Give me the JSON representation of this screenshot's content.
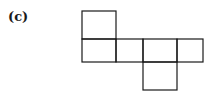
{
  "figure": {
    "label": "(c)",
    "line_color": "#1a1a1a",
    "squares": [
      {
        "id": "top",
        "x": 82,
        "y": 11,
        "w": 34,
        "h": 28
      },
      {
        "id": "row-1",
        "x": 82,
        "y": 39,
        "w": 34,
        "h": 23
      },
      {
        "id": "row-2",
        "x": 116,
        "y": 39,
        "w": 27,
        "h": 23
      },
      {
        "id": "row-3",
        "x": 143,
        "y": 39,
        "w": 34,
        "h": 23
      },
      {
        "id": "row-4",
        "x": 177,
        "y": 39,
        "w": 26,
        "h": 23
      },
      {
        "id": "bottom",
        "x": 143,
        "y": 62,
        "w": 34,
        "h": 28
      }
    ]
  }
}
